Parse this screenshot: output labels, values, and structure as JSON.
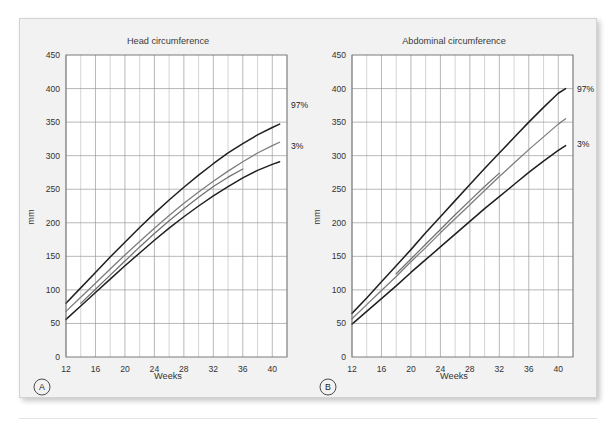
{
  "figure": {
    "background_color": "#f2f2f2",
    "panels": [
      {
        "letter": "A",
        "title": "Head circumference",
        "xlabel": "Weeks",
        "ylabel": "mm"
      },
      {
        "letter": "B",
        "title": "Abdominal circumference",
        "xlabel": "Weeks",
        "ylabel": "mm"
      }
    ]
  },
  "chart_data": [
    {
      "type": "line",
      "title": "Head circumference",
      "xlabel": "Weeks",
      "ylabel": "mm",
      "xlim": [
        12,
        42
      ],
      "ylim": [
        0,
        450
      ],
      "xticks": [
        12,
        16,
        20,
        24,
        28,
        32,
        36,
        40
      ],
      "yticks": [
        0,
        50,
        100,
        150,
        200,
        250,
        300,
        350,
        400,
        450
      ],
      "grid": true,
      "grid_minor_x_step": 2,
      "legend_position": "right-inline",
      "annotations": [
        {
          "text": "97%",
          "x": 41,
          "y": 375
        },
        {
          "text": "3%",
          "x": 41,
          "y": 315
        }
      ],
      "series": [
        {
          "name": "97%",
          "color": "#1f1f1f",
          "width": 1.5,
          "x": [
            12,
            14,
            16,
            18,
            20,
            22,
            24,
            26,
            28,
            30,
            32,
            34,
            36,
            38,
            40,
            41
          ],
          "y": [
            80,
            103,
            126,
            149,
            171,
            193,
            214,
            234,
            253,
            271,
            288,
            304,
            318,
            331,
            342,
            347
          ]
        },
        {
          "name": "50%",
          "color": "#7d7d7d",
          "width": 1.3,
          "x": [
            12,
            14,
            16,
            18,
            20,
            22,
            24,
            26,
            28,
            30,
            32,
            34,
            36,
            38,
            40,
            41
          ],
          "y": [
            68,
            89,
            110,
            131,
            152,
            172,
            192,
            211,
            229,
            246,
            262,
            277,
            291,
            304,
            315,
            320
          ]
        },
        {
          "name": "3%",
          "color": "#1f1f1f",
          "width": 1.5,
          "x": [
            12,
            14,
            16,
            18,
            20,
            22,
            24,
            26,
            28,
            30,
            32,
            34,
            36,
            38,
            40,
            41
          ],
          "y": [
            56,
            76,
            96,
            116,
            136,
            155,
            174,
            192,
            209,
            225,
            240,
            254,
            267,
            278,
            287,
            291
          ]
        },
        {
          "name": "median-segment",
          "color": "#6e6e6e",
          "width": 1.2,
          "x": [
            14,
            16,
            18,
            20,
            22,
            24,
            26,
            28,
            30,
            32,
            34,
            36
          ],
          "y": [
            80,
            101,
            122,
            143,
            164,
            184,
            203,
            221,
            238,
            254,
            268,
            280
          ]
        }
      ]
    },
    {
      "type": "line",
      "title": "Abdominal circumference",
      "xlabel": "Weeks",
      "ylabel": "mm",
      "xlim": [
        12,
        42
      ],
      "ylim": [
        0,
        450
      ],
      "xticks": [
        12,
        16,
        20,
        24,
        28,
        32,
        36,
        40
      ],
      "yticks": [
        0,
        50,
        100,
        150,
        200,
        250,
        300,
        350,
        400,
        450
      ],
      "grid": true,
      "grid_minor_x_step": 2,
      "legend_position": "right-inline",
      "annotations": [
        {
          "text": "97%",
          "x": 41,
          "y": 400
        },
        {
          "text": "3%",
          "x": 41,
          "y": 318
        }
      ],
      "series": [
        {
          "name": "97%",
          "color": "#1f1f1f",
          "width": 1.5,
          "x": [
            12,
            14,
            16,
            18,
            20,
            22,
            24,
            26,
            28,
            30,
            32,
            34,
            36,
            38,
            40,
            41
          ],
          "y": [
            65,
            88,
            112,
            136,
            160,
            185,
            209,
            233,
            257,
            281,
            304,
            327,
            350,
            372,
            393,
            400
          ]
        },
        {
          "name": "50%",
          "color": "#7d7d7d",
          "width": 1.3,
          "x": [
            12,
            14,
            16,
            18,
            20,
            22,
            24,
            26,
            28,
            30,
            32,
            34,
            36,
            38,
            40,
            41
          ],
          "y": [
            57,
            78,
            99,
            120,
            142,
            163,
            185,
            206,
            227,
            248,
            269,
            289,
            309,
            328,
            347,
            355
          ]
        },
        {
          "name": "3%",
          "color": "#1f1f1f",
          "width": 1.5,
          "x": [
            12,
            14,
            16,
            18,
            20,
            22,
            24,
            26,
            28,
            30,
            32,
            34,
            36,
            38,
            40,
            41
          ],
          "y": [
            49,
            68,
            87,
            106,
            126,
            145,
            164,
            183,
            202,
            221,
            239,
            257,
            275,
            292,
            308,
            315
          ]
        },
        {
          "name": "median-segment",
          "color": "#6e6e6e",
          "width": 1.2,
          "x": [
            18,
            20,
            22,
            24,
            26,
            28,
            30,
            32
          ],
          "y": [
            124,
            146,
            168,
            190,
            212,
            233,
            254,
            274
          ]
        }
      ]
    }
  ]
}
